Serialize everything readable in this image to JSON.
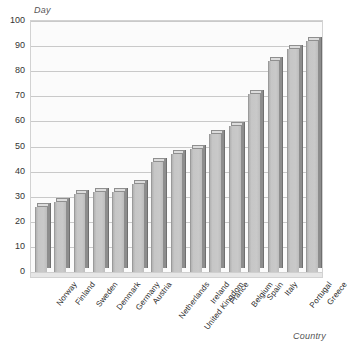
{
  "chart_data": {
    "type": "bar",
    "title": "",
    "subtitle": "",
    "xlabel": "Country",
    "ylabel": "Day",
    "ylim": [
      0,
      100
    ],
    "ytick_step": 10,
    "yticks": [
      "0",
      "10",
      "20",
      "30",
      "40",
      "50",
      "60",
      "70",
      "80",
      "90",
      "100"
    ],
    "grid": true,
    "legend": false,
    "legend_position": "none",
    "orientation": "vertical",
    "style": "3d-bars",
    "categories": [
      "Norway",
      "Finland",
      "Sweden",
      "Denmark",
      "Germany",
      "Austria",
      "Netherlands",
      "United Kingdom",
      "Ireland",
      "France",
      "Belgium",
      "Spain",
      "Italy",
      "Portugal",
      "Greece"
    ],
    "values": [
      26,
      28,
      31,
      32,
      32,
      35,
      44,
      47,
      49,
      55,
      58,
      71,
      84,
      89,
      92
    ],
    "colors": {
      "bar_front": "#c6c6c6",
      "bar_side": "#8d8d8d",
      "bar_top": "#dcdcdc",
      "plot_background": "#fbfbfb",
      "gridline": "#c9c9c9",
      "axis_border": "#d2d2d2",
      "text": "#2b2b2b",
      "axis_title": "#555555"
    }
  }
}
